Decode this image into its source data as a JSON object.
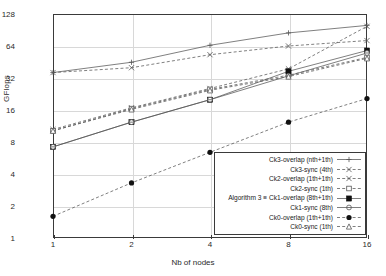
{
  "chart_data": {
    "type": "line",
    "title": "",
    "xlabel": "Nb of nodes",
    "ylabel": "GFlops",
    "xscale": "log2",
    "yscale": "log2",
    "x": [
      1,
      2,
      4,
      8,
      16
    ],
    "xticklabels": [
      "1",
      "2",
      "4",
      "8",
      "16"
    ],
    "yticklabels": [
      "1",
      "2",
      "4",
      "8",
      "16",
      "32",
      "64",
      "128"
    ],
    "ylim": [
      1,
      128
    ],
    "xlim": [
      1,
      16
    ],
    "grid": true,
    "legend_position": "lower right",
    "series": [
      {
        "name": "Ck3-overlap (nth+1th)",
        "marker": "plus",
        "linestyle": "solid",
        "values": [
          36,
          45,
          65,
          85,
          100
        ]
      },
      {
        "name": "Ck3-sync (4th)",
        "marker": "cross-open",
        "linestyle": "dashed",
        "values": [
          36,
          40,
          53,
          64,
          72
        ]
      },
      {
        "name": "Ck2-overlap (1th+1th)",
        "marker": "cross",
        "linestyle": "dashed",
        "values": [
          10.5,
          16.8,
          25.5,
          39,
          98
        ]
      },
      {
        "name": "Ck2-sync (1th)",
        "marker": "square-open",
        "linestyle": "dashed",
        "values": [
          10.2,
          16.5,
          25,
          34,
          50
        ]
      },
      {
        "name": "Algorithm 3 = Ck1-overlap (8th+1th)",
        "marker": "square-filled",
        "linestyle": "solid",
        "values": [
          7.2,
          12.3,
          20,
          37,
          58
        ]
      },
      {
        "name": "Ck1-sync (8th)",
        "marker": "circle-open",
        "linestyle": "solid",
        "values": [
          7.2,
          12.3,
          20,
          33.5,
          55
        ]
      },
      {
        "name": "Ck0-overlap (1th+1th)",
        "marker": "circle-filled",
        "linestyle": "dashed",
        "values": [
          1.6,
          3.3,
          6.4,
          12.3,
          20.5
        ]
      },
      {
        "name": "Ck0-sync (1th)",
        "marker": "triangle-open",
        "linestyle": "dashed",
        "values": [
          10.2,
          16.2,
          24.5,
          33,
          49
        ]
      }
    ]
  },
  "legend": {
    "items": [
      "Ck3-overlap (nth+1th)",
      "Ck3-sync (4th)",
      "Ck2-overlap (1th+1th)",
      "Ck2-sync (1th)",
      "Algorithm 3 ≡ Ck1-overlap (8th+1th)",
      "Ck1-sync (8th)",
      "Ck0-overlap (1th+1th)",
      "Ck0-sync (1th)"
    ]
  },
  "axes": {
    "y_label": "GFlops",
    "x_label": "Nb of nodes",
    "y_ticks": [
      "128",
      "64",
      "32",
      "16",
      "8",
      "4",
      "2",
      "1"
    ],
    "x_ticks": [
      "1",
      "2",
      "4",
      "8",
      "16"
    ]
  },
  "colors": {
    "axis": "#3a3a3a",
    "grid": "#d8d8d8",
    "line": "#555555",
    "text": "#1a1a1a"
  }
}
